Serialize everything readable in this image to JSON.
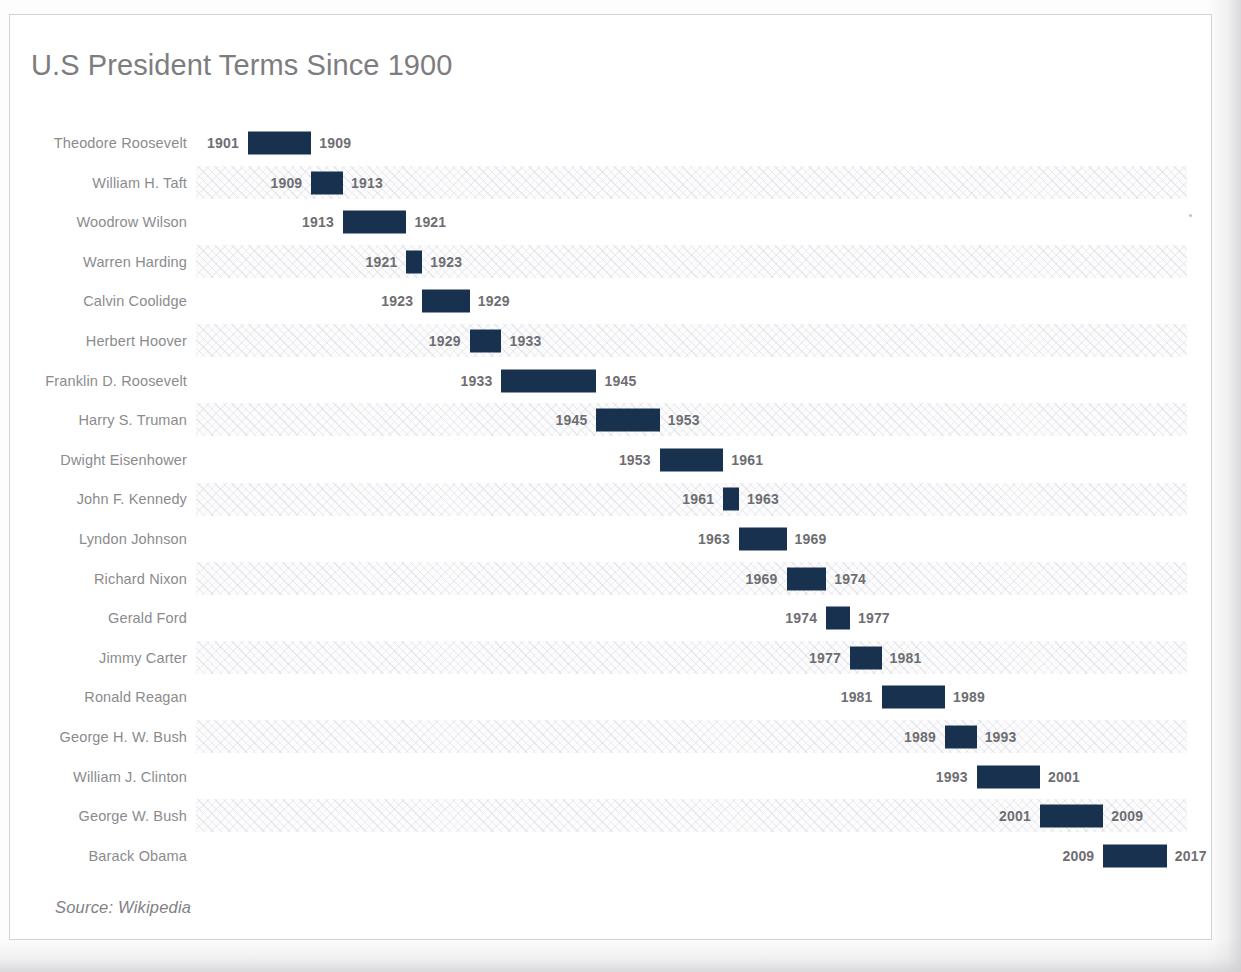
{
  "chart_title": "U.S President Terms Since 1900",
  "source_note": "Source: Wikipedia",
  "chart_data": {
    "type": "bar",
    "subtype": "gantt-timeline",
    "title": "U.S President Terms Since 1900",
    "subtitle": "",
    "xlabel": "",
    "ylabel": "",
    "xlim": [
      1901,
      2017
    ],
    "orientation": "horizontal",
    "grid": false,
    "legend": null,
    "bar_color": "#17314f",
    "label_color": "#8b8b8e",
    "value_color": "#6e6e72",
    "title_color": "#7d7d7f",
    "categories": [
      "Theodore Roosevelt",
      "William H. Taft",
      "Woodrow Wilson",
      "Warren Harding",
      "Calvin Coolidge",
      "Herbert Hoover",
      "Franklin D. Roosevelt",
      "Harry S. Truman",
      "Dwight Eisenhower",
      "John F. Kennedy",
      "Lyndon Johnson",
      "Richard Nixon",
      "Gerald Ford",
      "Jimmy Carter",
      "Ronald Reagan",
      "George H. W. Bush",
      "William J. Clinton",
      "George W. Bush",
      "Barack Obama"
    ],
    "series": [
      {
        "name": "Term",
        "start": [
          1901,
          1909,
          1913,
          1921,
          1923,
          1929,
          1933,
          1945,
          1953,
          1961,
          1963,
          1969,
          1974,
          1977,
          1981,
          1989,
          1993,
          2001,
          2009
        ],
        "end": [
          1909,
          1913,
          1921,
          1923,
          1929,
          1933,
          1945,
          1953,
          1961,
          1963,
          1969,
          1974,
          1977,
          1981,
          1989,
          1993,
          2001,
          2009,
          2017
        ],
        "duration": [
          8,
          4,
          8,
          2,
          6,
          4,
          12,
          8,
          8,
          2,
          6,
          5,
          3,
          4,
          8,
          4,
          8,
          8,
          8
        ]
      }
    ],
    "rows": [
      {
        "label": "Theodore Roosevelt",
        "start": 1901,
        "end": 1909,
        "start_text": "1901",
        "end_text": "1909"
      },
      {
        "label": "William H. Taft",
        "start": 1909,
        "end": 1913,
        "start_text": "1909",
        "end_text": "1913"
      },
      {
        "label": "Woodrow Wilson",
        "start": 1913,
        "end": 1921,
        "start_text": "1913",
        "end_text": "1921"
      },
      {
        "label": "Warren Harding",
        "start": 1921,
        "end": 1923,
        "start_text": "1921",
        "end_text": "1923"
      },
      {
        "label": "Calvin Coolidge",
        "start": 1923,
        "end": 1929,
        "start_text": "1923",
        "end_text": "1929"
      },
      {
        "label": "Herbert Hoover",
        "start": 1929,
        "end": 1933,
        "start_text": "1929",
        "end_text": "1933"
      },
      {
        "label": "Franklin D. Roosevelt",
        "start": 1933,
        "end": 1945,
        "start_text": "1933",
        "end_text": "1945"
      },
      {
        "label": "Harry S. Truman",
        "start": 1945,
        "end": 1953,
        "start_text": "1945",
        "end_text": "1953"
      },
      {
        "label": "Dwight Eisenhower",
        "start": 1953,
        "end": 1961,
        "start_text": "1953",
        "end_text": "1961"
      },
      {
        "label": "John F. Kennedy",
        "start": 1961,
        "end": 1963,
        "start_text": "1961",
        "end_text": "1963"
      },
      {
        "label": "Lyndon Johnson",
        "start": 1963,
        "end": 1969,
        "start_text": "1963",
        "end_text": "1969"
      },
      {
        "label": "Richard Nixon",
        "start": 1969,
        "end": 1974,
        "start_text": "1969",
        "end_text": "1974"
      },
      {
        "label": "Gerald Ford",
        "start": 1974,
        "end": 1977,
        "start_text": "1974",
        "end_text": "1977"
      },
      {
        "label": "Jimmy Carter",
        "start": 1977,
        "end": 1981,
        "start_text": "1977",
        "end_text": "1981"
      },
      {
        "label": "Ronald Reagan",
        "start": 1981,
        "end": 1989,
        "start_text": "1981",
        "end_text": "1989"
      },
      {
        "label": "George H. W. Bush",
        "start": 1989,
        "end": 1993,
        "start_text": "1989",
        "end_text": "1993"
      },
      {
        "label": "William J. Clinton",
        "start": 1993,
        "end": 2001,
        "start_text": "1993",
        "end_text": "2001"
      },
      {
        "label": "George W. Bush",
        "start": 2001,
        "end": 2009,
        "start_text": "2001",
        "end_text": "2009"
      },
      {
        "label": "Barack Obama",
        "start": 2009,
        "end": 2017,
        "start_text": "2009",
        "end_text": "2017"
      }
    ]
  },
  "layout": {
    "first_row_center_y": 128,
    "row_pitch": 39.6,
    "x_origin_px": 238,
    "px_per_year": 7.92
  }
}
